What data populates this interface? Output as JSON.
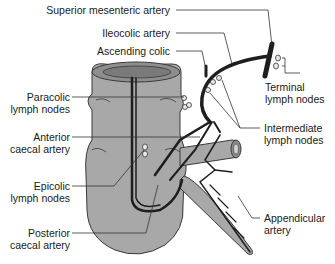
{
  "diagram": {
    "colors": {
      "colon_fill": "#a8a8a8",
      "colon_dark": "#7a7a7a",
      "artery": "#1e1e1e",
      "leader": "#333333",
      "background": "#ffffff"
    },
    "labels": {
      "superior_mesenteric": "Superior mesenteric artery",
      "ileocolic": "Ileocolic artery",
      "ascending_colic": "Ascending colic",
      "paracolic_1": "Paracolic",
      "paracolic_2": "lymph nodes",
      "anterior_caecal_1": "Anterior",
      "anterior_caecal_2": "caecal artery",
      "epicolic_1": "Epicolic",
      "epicolic_2": "lymph nodes",
      "posterior_caecal_1": "Posterior",
      "posterior_caecal_2": "caecal artery",
      "terminal_1": "Terminal",
      "terminal_2": "lymph nodes",
      "intermediate_1": "Intermediate",
      "intermediate_2": "lymph nodes",
      "appendicular_1": "Appendicular",
      "appendicular_2": "artery"
    }
  }
}
